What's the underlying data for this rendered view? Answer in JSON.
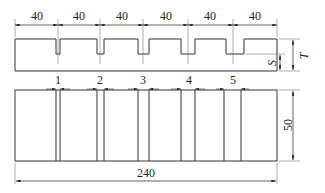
{
  "diagram": {
    "type": "technical-drawing",
    "top_view": {
      "spacing_dims": [
        "40",
        "40",
        "40",
        "40",
        "40",
        "40"
      ],
      "depth_labels": {
        "total_thickness": "T",
        "slot_depth": "S"
      }
    },
    "plan_view": {
      "slot_labels": [
        "1",
        "2",
        "3",
        "4",
        "5"
      ],
      "length_dim": "240",
      "width_dim": "50"
    },
    "colors": {
      "line": "#333333",
      "background": "#ffffff"
    }
  }
}
